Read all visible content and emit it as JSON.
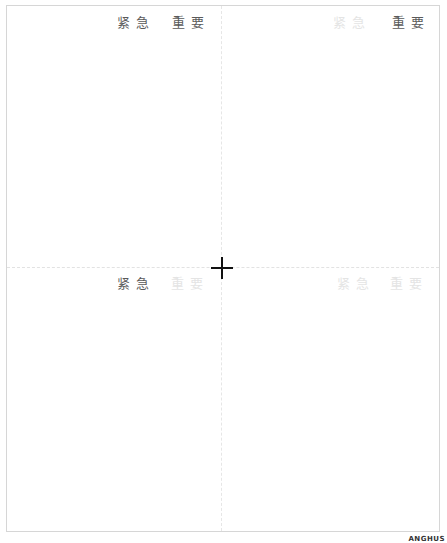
{
  "quadrants": {
    "top_left": {
      "urgent": "紧急",
      "important": "重要",
      "urgent_active": true,
      "important_active": true
    },
    "top_right": {
      "urgent": "紧急",
      "important": "重要",
      "urgent_active": false,
      "important_active": true
    },
    "bottom_left": {
      "urgent": "紧急",
      "important": "重要",
      "urgent_active": true,
      "important_active": false
    },
    "bottom_right": {
      "urgent": "紧急",
      "important": "重要",
      "urgent_active": false,
      "important_active": false
    }
  },
  "crosshair_icon": "plus-crosshair",
  "stamp": "ANGHUS"
}
